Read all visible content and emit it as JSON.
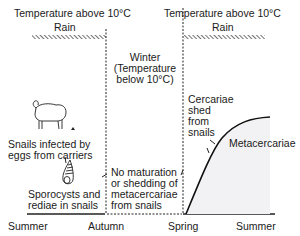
{
  "header": {
    "left_temperature": "Temperature above 10°C",
    "right_temperature": "Temperature above 10°C",
    "left_rain": "Rain",
    "right_rain": "Rain"
  },
  "winter": {
    "line1": "Winter",
    "line2": "(Temperature",
    "line3": "below 10°C)"
  },
  "left_panel": {
    "snails_line1": "Snails infected by",
    "snails_line2": "eggs from carriers",
    "sporocysts_line1": "Sporocysts and",
    "sporocysts_line2": "rediae in snails",
    "sheep_icon": "sheep-icon",
    "snail_icon": "snail-shell-icon",
    "egg_icon": "egg-icon"
  },
  "middle_panel": {
    "line1": "No maturation",
    "line2": "or shedding of",
    "line3": "metacercariae",
    "line4": "from snails"
  },
  "right_panel": {
    "cercariae_line1": "Cercariae",
    "cercariae_line2": "shed",
    "cercariae_line3": "from",
    "cercariae_line4": "snails",
    "metacercariae": "Metacercariae"
  },
  "seasons": [
    "Summer",
    "Autumn",
    "Spring",
    "Summer"
  ],
  "colors": {
    "line": "#1a1a1a",
    "shade": "#f2f2f4"
  }
}
